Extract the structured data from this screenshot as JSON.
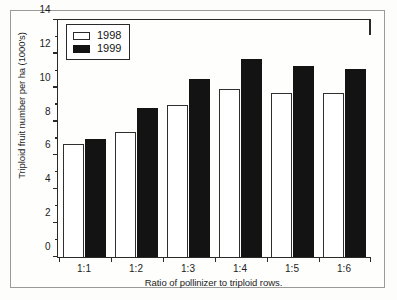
{
  "chart_data": {
    "type": "bar",
    "title": "",
    "subtitle": "",
    "xlabel": "Ratio of pollinizer to triploid rows.",
    "ylabel": "Triploid fruit number per ha (1000's)",
    "categories": [
      "1:1",
      "1:2",
      "1:3",
      "1:4",
      "1:5",
      "1:6"
    ],
    "series": [
      {
        "name": "1998",
        "color": "#ffffff",
        "values": [
          6.7,
          7.4,
          9.0,
          9.9,
          9.7,
          9.7
        ]
      },
      {
        "name": "1999",
        "color": "#131313",
        "values": [
          7.0,
          8.8,
          10.5,
          11.7,
          11.3,
          11.1
        ]
      }
    ],
    "ylim": [
      0,
      14
    ],
    "y_major_ticks": [
      0,
      2,
      4,
      6,
      8,
      10,
      12,
      14
    ],
    "y_major_tick_labels": [
      "0",
      "2",
      "4",
      "6",
      "8",
      "10",
      "12",
      "14"
    ],
    "y_minor_ticks": [
      1,
      3,
      5,
      7,
      9,
      11,
      13
    ],
    "grid": false,
    "legend_position": "top-left-inside",
    "legend_entries": [
      "1998",
      "1999"
    ]
  }
}
